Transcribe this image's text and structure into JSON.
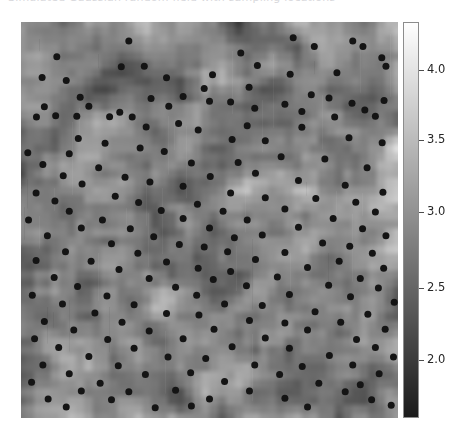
{
  "figure": {
    "background_color": "#ffffff",
    "width": 463,
    "height": 440,
    "clipped_title": "Simulated Gaussian random field with sampling locations"
  },
  "panel": {
    "label": "random-field-image",
    "left": 21,
    "top": 22,
    "width": 377,
    "height": 396,
    "background_color": "#9a9a9a"
  },
  "colorbar": {
    "orientation": "vertical",
    "left": 403,
    "top": 22,
    "width": 16,
    "height": 396,
    "colormap": "gray",
    "low_color": "#1a1a1a",
    "high_color": "#ffffff",
    "vmin": 1.62,
    "vmax": 4.34,
    "ticks": [
      {
        "value": "4.0",
        "y": 70
      },
      {
        "value": "3.5",
        "y": 140
      },
      {
        "value": "3.0",
        "y": 212
      },
      {
        "value": "2.5",
        "y": 288
      },
      {
        "value": "2.0",
        "y": 360
      }
    ]
  },
  "chart_data": {
    "type": "heatmap",
    "title": "",
    "xlabel": "",
    "ylabel": "",
    "colorbar_label": "",
    "colormap": "gray",
    "grid": false,
    "legend": "none",
    "zlim": [
      1.62,
      4.34
    ],
    "colorbar_ticks": [
      2.0,
      2.5,
      3.0,
      3.5,
      4.0
    ],
    "xlim": [
      0,
      1
    ],
    "ylim": [
      0,
      1
    ],
    "axis_ticks_visible": false,
    "overlay": {
      "type": "scatter",
      "marker": "filled-circle",
      "marker_color": "#141414",
      "marker_size_px": 7,
      "n_points": 204,
      "points": [
        [
          0.095,
          0.088
        ],
        [
          0.286,
          0.048
        ],
        [
          0.722,
          0.04
        ],
        [
          0.88,
          0.048
        ],
        [
          0.907,
          0.062
        ],
        [
          0.056,
          0.14
        ],
        [
          0.266,
          0.113
        ],
        [
          0.327,
          0.112
        ],
        [
          0.583,
          0.078
        ],
        [
          0.778,
          0.062
        ],
        [
          0.12,
          0.148
        ],
        [
          0.386,
          0.141
        ],
        [
          0.508,
          0.133
        ],
        [
          0.627,
          0.11
        ],
        [
          0.957,
          0.09
        ],
        [
          0.157,
          0.19
        ],
        [
          0.43,
          0.188
        ],
        [
          0.714,
          0.132
        ],
        [
          0.838,
          0.128
        ],
        [
          0.968,
          0.112
        ],
        [
          0.062,
          0.214
        ],
        [
          0.18,
          0.213
        ],
        [
          0.345,
          0.193
        ],
        [
          0.486,
          0.168
        ],
        [
          0.605,
          0.165
        ],
        [
          0.041,
          0.24
        ],
        [
          0.148,
          0.238
        ],
        [
          0.262,
          0.228
        ],
        [
          0.5,
          0.2
        ],
        [
          0.77,
          0.184
        ],
        [
          0.092,
          0.237
        ],
        [
          0.235,
          0.239
        ],
        [
          0.392,
          0.213
        ],
        [
          0.556,
          0.202
        ],
        [
          0.817,
          0.192
        ],
        [
          0.295,
          0.24
        ],
        [
          0.62,
          0.218
        ],
        [
          0.7,
          0.208
        ],
        [
          0.878,
          0.205
        ],
        [
          0.963,
          0.198
        ],
        [
          0.152,
          0.294
        ],
        [
          0.332,
          0.265
        ],
        [
          0.418,
          0.256
        ],
        [
          0.745,
          0.226
        ],
        [
          0.912,
          0.222
        ],
        [
          0.223,
          0.306
        ],
        [
          0.47,
          0.273
        ],
        [
          0.6,
          0.262
        ],
        [
          0.832,
          0.24
        ],
        [
          0.94,
          0.238
        ],
        [
          0.018,
          0.33
        ],
        [
          0.128,
          0.333
        ],
        [
          0.316,
          0.318
        ],
        [
          0.56,
          0.297
        ],
        [
          0.745,
          0.266
        ],
        [
          0.38,
          0.327
        ],
        [
          0.648,
          0.3
        ],
        [
          0.87,
          0.292
        ],
        [
          0.958,
          0.305
        ],
        [
          0.058,
          0.36
        ],
        [
          0.206,
          0.368
        ],
        [
          0.452,
          0.356
        ],
        [
          0.576,
          0.355
        ],
        [
          0.69,
          0.34
        ],
        [
          0.806,
          0.346
        ],
        [
          0.112,
          0.388
        ],
        [
          0.276,
          0.392
        ],
        [
          0.502,
          0.39
        ],
        [
          0.622,
          0.382
        ],
        [
          0.918,
          0.368
        ],
        [
          0.162,
          0.409
        ],
        [
          0.342,
          0.404
        ],
        [
          0.43,
          0.415
        ],
        [
          0.736,
          0.4
        ],
        [
          0.86,
          0.412
        ],
        [
          0.04,
          0.432
        ],
        [
          0.25,
          0.44
        ],
        [
          0.556,
          0.432
        ],
        [
          0.648,
          0.444
        ],
        [
          0.96,
          0.43
        ],
        [
          0.09,
          0.452
        ],
        [
          0.312,
          0.456
        ],
        [
          0.468,
          0.46
        ],
        [
          0.782,
          0.446
        ],
        [
          0.888,
          0.455
        ],
        [
          0.128,
          0.478
        ],
        [
          0.372,
          0.476
        ],
        [
          0.536,
          0.478
        ],
        [
          0.7,
          0.472
        ],
        [
          0.94,
          0.48
        ],
        [
          0.02,
          0.5
        ],
        [
          0.216,
          0.5
        ],
        [
          0.43,
          0.496
        ],
        [
          0.6,
          0.5
        ],
        [
          0.828,
          0.496
        ],
        [
          0.16,
          0.52
        ],
        [
          0.29,
          0.522
        ],
        [
          0.5,
          0.52
        ],
        [
          0.736,
          0.518
        ],
        [
          0.906,
          0.522
        ],
        [
          0.07,
          0.54
        ],
        [
          0.352,
          0.542
        ],
        [
          0.566,
          0.545
        ],
        [
          0.64,
          0.538
        ],
        [
          0.968,
          0.54
        ],
        [
          0.24,
          0.56
        ],
        [
          0.42,
          0.562
        ],
        [
          0.486,
          0.568
        ],
        [
          0.8,
          0.558
        ],
        [
          0.872,
          0.566
        ],
        [
          0.118,
          0.58
        ],
        [
          0.31,
          0.584
        ],
        [
          0.548,
          0.58
        ],
        [
          0.7,
          0.582
        ],
        [
          0.932,
          0.584
        ],
        [
          0.04,
          0.602
        ],
        [
          0.186,
          0.604
        ],
        [
          0.386,
          0.606
        ],
        [
          0.622,
          0.6
        ],
        [
          0.844,
          0.604
        ],
        [
          0.26,
          0.625
        ],
        [
          0.47,
          0.622
        ],
        [
          0.556,
          0.63
        ],
        [
          0.76,
          0.62
        ],
        [
          0.962,
          0.622
        ],
        [
          0.088,
          0.645
        ],
        [
          0.34,
          0.648
        ],
        [
          0.51,
          0.65
        ],
        [
          0.68,
          0.644
        ],
        [
          0.9,
          0.648
        ],
        [
          0.15,
          0.668
        ],
        [
          0.41,
          0.67
        ],
        [
          0.598,
          0.666
        ],
        [
          0.816,
          0.665
        ],
        [
          0.948,
          0.672
        ],
        [
          0.03,
          0.69
        ],
        [
          0.228,
          0.692
        ],
        [
          0.466,
          0.69
        ],
        [
          0.712,
          0.688
        ],
        [
          0.874,
          0.694
        ],
        [
          0.11,
          0.712
        ],
        [
          0.3,
          0.714
        ],
        [
          0.54,
          0.712
        ],
        [
          0.64,
          0.716
        ],
        [
          0.99,
          0.708
        ],
        [
          0.196,
          0.735
        ],
        [
          0.386,
          0.736
        ],
        [
          0.472,
          0.74
        ],
        [
          0.78,
          0.732
        ],
        [
          0.92,
          0.738
        ],
        [
          0.062,
          0.756
        ],
        [
          0.268,
          0.758
        ],
        [
          0.606,
          0.754
        ],
        [
          0.7,
          0.76
        ],
        [
          0.848,
          0.758
        ],
        [
          0.14,
          0.778
        ],
        [
          0.34,
          0.78
        ],
        [
          0.512,
          0.776
        ],
        [
          0.76,
          0.778
        ],
        [
          0.966,
          0.776
        ],
        [
          0.036,
          0.8
        ],
        [
          0.23,
          0.802
        ],
        [
          0.43,
          0.8
        ],
        [
          0.648,
          0.798
        ],
        [
          0.89,
          0.802
        ],
        [
          0.1,
          0.822
        ],
        [
          0.3,
          0.824
        ],
        [
          0.56,
          0.82
        ],
        [
          0.712,
          0.824
        ],
        [
          0.94,
          0.822
        ],
        [
          0.18,
          0.845
        ],
        [
          0.39,
          0.846
        ],
        [
          0.49,
          0.85
        ],
        [
          0.818,
          0.842
        ],
        [
          0.988,
          0.846
        ],
        [
          0.058,
          0.866
        ],
        [
          0.258,
          0.868
        ],
        [
          0.62,
          0.866
        ],
        [
          0.746,
          0.87
        ],
        [
          0.88,
          0.866
        ],
        [
          0.128,
          0.888
        ],
        [
          0.33,
          0.89
        ],
        [
          0.45,
          0.886
        ],
        [
          0.686,
          0.89
        ],
        [
          0.95,
          0.888
        ],
        [
          0.028,
          0.91
        ],
        [
          0.21,
          0.912
        ],
        [
          0.54,
          0.908
        ],
        [
          0.79,
          0.912
        ],
        [
          0.9,
          0.916
        ],
        [
          0.16,
          0.932
        ],
        [
          0.286,
          0.934
        ],
        [
          0.41,
          0.93
        ],
        [
          0.606,
          0.932
        ],
        [
          0.86,
          0.934
        ],
        [
          0.072,
          0.952
        ],
        [
          0.24,
          0.954
        ],
        [
          0.5,
          0.952
        ],
        [
          0.7,
          0.95
        ],
        [
          0.93,
          0.954
        ],
        [
          0.12,
          0.972
        ],
        [
          0.356,
          0.974
        ],
        [
          0.452,
          0.97
        ],
        [
          0.76,
          0.972
        ],
        [
          0.982,
          0.968
        ]
      ]
    }
  }
}
